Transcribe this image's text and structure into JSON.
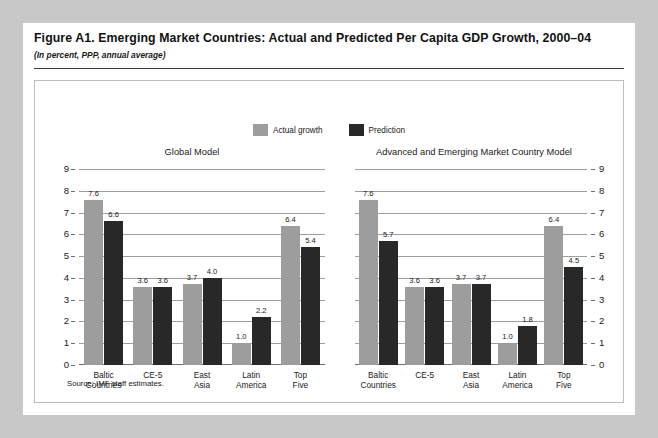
{
  "figure": {
    "title": "Figure A1. Emerging Market Countries: Actual and Predicted Per Capita GDP Growth, 2000–04",
    "subtitle": "(In percent, PPP, annual average)",
    "source": "Source: IMF staff estimates."
  },
  "legend": {
    "items": [
      {
        "label": "Actual growth",
        "color": "#9d9d9d",
        "swatch": "actual-growth-swatch"
      },
      {
        "label": "Prediction",
        "color": "#282828",
        "swatch": "prediction-swatch"
      }
    ]
  },
  "colors": {
    "actual": "#9d9d9d",
    "prediction": "#282828",
    "gridline": "#9e9e9e",
    "page_background": "#ffffff",
    "outer_background": "#c8c8c8"
  },
  "chart_data": [
    {
      "type": "bar",
      "title": "Global Model",
      "xlabel": "",
      "ylabel": "",
      "ylim": [
        0,
        9
      ],
      "yticks": [
        0,
        1,
        2,
        3,
        4,
        5,
        6,
        7,
        8,
        9
      ],
      "axis_position": "left",
      "grid": true,
      "legend_position": "top-center",
      "categories": [
        "Baltic Countries",
        "CE-5",
        "East Asia",
        "Latin America",
        "Top Five"
      ],
      "series": [
        {
          "name": "Actual growth",
          "values": [
            7.6,
            3.6,
            3.7,
            1.0,
            6.4
          ]
        },
        {
          "name": "Prediction",
          "values": [
            6.6,
            3.6,
            4.0,
            2.2,
            5.4
          ]
        }
      ]
    },
    {
      "type": "bar",
      "title": "Advanced and Emerging Market Country Model",
      "xlabel": "",
      "ylabel": "",
      "ylim": [
        0,
        9
      ],
      "yticks": [
        0,
        1,
        2,
        3,
        4,
        5,
        6,
        7,
        8,
        9
      ],
      "axis_position": "right",
      "grid": true,
      "legend_position": "top-center",
      "categories": [
        "Baltic Countries",
        "CE-5",
        "East Asia",
        "Latin America",
        "Top Five"
      ],
      "series": [
        {
          "name": "Actual growth",
          "values": [
            7.6,
            3.6,
            3.7,
            1.0,
            6.4
          ]
        },
        {
          "name": "Prediction",
          "values": [
            5.7,
            3.6,
            3.7,
            1.8,
            4.5
          ]
        }
      ]
    }
  ]
}
